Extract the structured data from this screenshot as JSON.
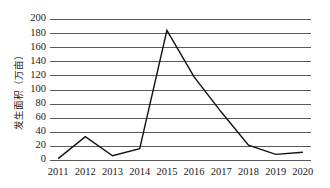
{
  "chart_data": {
    "type": "line",
    "title": "",
    "subtitle": "",
    "xlabel": "",
    "ylabel": "发生面积（万亩）",
    "categories": [
      "2011",
      "2012",
      "2013",
      "2014",
      "2015",
      "2016",
      "2017",
      "2018",
      "2019",
      "2020"
    ],
    "series": [
      {
        "name": "发生面积",
        "values": [
          2,
          33,
          6,
          16,
          184,
          118,
          68,
          21,
          8,
          11
        ]
      }
    ],
    "ylim": [
      0,
      200
    ],
    "yticks": [
      0,
      20,
      40,
      60,
      80,
      100,
      120,
      140,
      160,
      180,
      200
    ],
    "ytick_labels": [
      "0",
      "20",
      "40",
      "60",
      "80",
      "100",
      "120",
      "140",
      "160",
      "180",
      "200"
    ],
    "xtick_labels": [
      "2011",
      "2012",
      "2013",
      "2014",
      "2015",
      "2016",
      "2017",
      "2018",
      "2019",
      "2020"
    ],
    "grid": true,
    "grid_axis": "y",
    "legend": false,
    "legend_position": "none",
    "line_color": "#111111",
    "grid_color": "#5a5a5a",
    "background_color": "#ffffff",
    "markers": false
  },
  "axis": {
    "y_title": "发生面积（万亩）"
  }
}
